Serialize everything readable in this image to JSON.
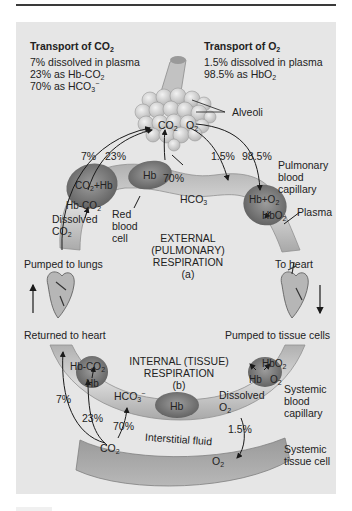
{
  "figure": {
    "co2_transport": {
      "title": "Transport of CO",
      "title_sub": "2",
      "lines": [
        {
          "text": "7% dissolved in plasma",
          "sub": ""
        },
        {
          "text": "23% as Hb-CO",
          "sub": "2"
        },
        {
          "text": "70% as HCO",
          "sub": "3",
          "sup": "−"
        }
      ]
    },
    "o2_transport": {
      "title": "Transport of O",
      "title_sub": "2",
      "lines": [
        {
          "text": "1.5% dissolved in plasma",
          "sub": ""
        },
        {
          "text": "98.5% as HbO",
          "sub": "2"
        }
      ]
    },
    "labels": {
      "alveoli": "Alveoli",
      "co2_alv": "CO",
      "o2_alv": "O",
      "sub2": "2",
      "sub3": "3",
      "pct_7_top": "7%",
      "pct_23_top": "23%",
      "pct_70_top": "70%",
      "pct_1_5_top": "1.5%",
      "pct_98_5_top": "98.5%",
      "pulmonary_capillary": [
        "Pulmonary",
        "blood",
        "capillary"
      ],
      "plasma": "Plasma",
      "co2_hb": "CO",
      "co2_hb_rest": "+Hb",
      "hb_co2_top": "Hb-CO",
      "dissolved_co2": [
        "Dissolved",
        "CO"
      ],
      "hb_top": "Hb",
      "red_blood_cell": [
        "Red",
        "blood",
        "cell"
      ],
      "hco3_top": "HCO",
      "hb_o2_top": "Hb+O",
      "hbo2_top": "HbO",
      "external_resp": [
        "EXTERNAL",
        "(PULMONARY)",
        "RESPIRATION",
        "(a)"
      ],
      "pumped_to_lungs": "Pumped to lungs",
      "to_heart": "To heart",
      "returned_to_heart": "Returned to heart",
      "pumped_to_tissue": "Pumped to tissue cells",
      "internal_resp": [
        "INTERNAL (TISSUE)",
        "RESPIRATION",
        "(b)"
      ],
      "hb_co2_bottom": "Hb-CO",
      "hb_bottom_cell": "Hb",
      "hco3_bottom": "HCO",
      "hb_bottom_mid": "Hb",
      "hbo2_bottom": "HbO",
      "hb_bottom_right": "Hb",
      "o2_bottom_right": "O",
      "dissolved_o2": [
        "Dissolved",
        "O"
      ],
      "systemic_capillary": [
        "Systemic",
        "blood",
        "capillary"
      ],
      "pct_7_bottom": "7%",
      "pct_23_bottom": "23%",
      "pct_70_bottom": "70%",
      "pct_1_5_bottom": "1.5%",
      "interstitial_fluid": "Interstitial fluid",
      "co2_tissue": "CO",
      "o2_tissue": "O",
      "systemic_tissue_cell": [
        "Systemic",
        "tissue cell"
      ]
    },
    "colors": {
      "panel_bg": "#e6e6e6",
      "capillary": "#c8c8c8",
      "capillary_dark": "#a8a8a8",
      "rbc": "#8a8a8a",
      "tissue_cell": "#a0a0a0",
      "alveoli": "#d8d8d8",
      "arrow": "#1a1a1a"
    }
  }
}
